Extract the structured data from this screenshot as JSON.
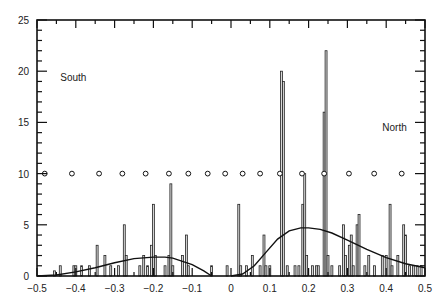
{
  "chart_data": {
    "type": "bar",
    "subtype": "histogram-with-fitted-curves",
    "title": "",
    "xlabel": "",
    "ylabel": "",
    "xlim": [
      -0.5,
      0.5
    ],
    "ylim": [
      0,
      25
    ],
    "grid": false,
    "x_ticks": [
      -0.5,
      -0.4,
      -0.3,
      -0.2,
      -0.1,
      0,
      0.1,
      0.2,
      0.3,
      0.4,
      0.5
    ],
    "x_tick_labels": [
      "-0.5",
      "-0.4",
      "-0.3",
      "-0.2",
      "-0.1",
      "0",
      "0.1",
      "0.2",
      "0.3",
      "0.4",
      "0.5"
    ],
    "y_ticks": [
      0,
      5,
      10,
      15,
      20,
      25
    ],
    "y_tick_labels": [
      "0",
      "5",
      "10",
      "15",
      "20",
      "25"
    ],
    "annotations": [
      {
        "text": "South",
        "x": -0.44,
        "y": 19.0
      },
      {
        "text": "North",
        "x": 0.39,
        "y": 14.2
      }
    ],
    "histogram": {
      "bin_width": 0.005,
      "bars": [
        {
          "x": -0.455,
          "y": 0.5
        },
        {
          "x": -0.44,
          "y": 1
        },
        {
          "x": -0.405,
          "y": 1
        },
        {
          "x": -0.4,
          "y": 1
        },
        {
          "x": -0.385,
          "y": 1
        },
        {
          "x": -0.365,
          "y": 1
        },
        {
          "x": -0.345,
          "y": 3
        },
        {
          "x": -0.325,
          "y": 2
        },
        {
          "x": -0.31,
          "y": 1
        },
        {
          "x": -0.29,
          "y": 1
        },
        {
          "x": -0.275,
          "y": 5
        },
        {
          "x": -0.27,
          "y": 2
        },
        {
          "x": -0.235,
          "y": 1
        },
        {
          "x": -0.225,
          "y": 2
        },
        {
          "x": -0.215,
          "y": 1
        },
        {
          "x": -0.205,
          "y": 3
        },
        {
          "x": -0.2,
          "y": 7
        },
        {
          "x": -0.195,
          "y": 2
        },
        {
          "x": -0.17,
          "y": 1
        },
        {
          "x": -0.16,
          "y": 2
        },
        {
          "x": -0.155,
          "y": 9
        },
        {
          "x": -0.15,
          "y": 1
        },
        {
          "x": -0.125,
          "y": 2
        },
        {
          "x": -0.115,
          "y": 4
        },
        {
          "x": -0.11,
          "y": 1
        },
        {
          "x": -0.05,
          "y": 1
        },
        {
          "x": -0.01,
          "y": 1
        },
        {
          "x": 0.02,
          "y": 7
        },
        {
          "x": 0.025,
          "y": 1
        },
        {
          "x": 0.04,
          "y": 1
        },
        {
          "x": 0.055,
          "y": 2
        },
        {
          "x": 0.075,
          "y": 1
        },
        {
          "x": 0.085,
          "y": 4
        },
        {
          "x": 0.09,
          "y": 1
        },
        {
          "x": 0.1,
          "y": 1
        },
        {
          "x": 0.13,
          "y": 20
        },
        {
          "x": 0.135,
          "y": 19
        },
        {
          "x": 0.145,
          "y": 1
        },
        {
          "x": 0.165,
          "y": 1
        },
        {
          "x": 0.175,
          "y": 1
        },
        {
          "x": 0.185,
          "y": 7
        },
        {
          "x": 0.19,
          "y": 10
        },
        {
          "x": 0.195,
          "y": 2
        },
        {
          "x": 0.21,
          "y": 1
        },
        {
          "x": 0.22,
          "y": 1
        },
        {
          "x": 0.225,
          "y": 1
        },
        {
          "x": 0.24,
          "y": 16
        },
        {
          "x": 0.245,
          "y": 22
        },
        {
          "x": 0.25,
          "y": 2
        },
        {
          "x": 0.26,
          "y": 1
        },
        {
          "x": 0.28,
          "y": 1
        },
        {
          "x": 0.29,
          "y": 5
        },
        {
          "x": 0.295,
          "y": 2
        },
        {
          "x": 0.305,
          "y": 3
        },
        {
          "x": 0.31,
          "y": 4
        },
        {
          "x": 0.315,
          "y": 1
        },
        {
          "x": 0.325,
          "y": 5
        },
        {
          "x": 0.33,
          "y": 6
        },
        {
          "x": 0.345,
          "y": 1
        },
        {
          "x": 0.355,
          "y": 2
        },
        {
          "x": 0.37,
          "y": 1
        },
        {
          "x": 0.39,
          "y": 2
        },
        {
          "x": 0.4,
          "y": 2
        },
        {
          "x": 0.41,
          "y": 7
        },
        {
          "x": 0.415,
          "y": 1
        },
        {
          "x": 0.43,
          "y": 2
        },
        {
          "x": 0.445,
          "y": 5
        },
        {
          "x": 0.45,
          "y": 4
        },
        {
          "x": 0.46,
          "y": 1
        },
        {
          "x": 0.47,
          "y": 1
        },
        {
          "x": 0.48,
          "y": 1
        },
        {
          "x": 0.49,
          "y": 1
        }
      ]
    },
    "series": [
      {
        "name": "South fit",
        "type": "line",
        "x": [
          -0.5,
          -0.45,
          -0.4,
          -0.35,
          -0.3,
          -0.25,
          -0.2,
          -0.17,
          -0.15,
          -0.1,
          -0.07,
          -0.05
        ],
        "values": [
          0,
          0.1,
          0.4,
          0.8,
          1.3,
          1.7,
          1.85,
          1.85,
          1.75,
          1.1,
          0.5,
          0
        ]
      },
      {
        "name": "North fit",
        "type": "line",
        "x": [
          0,
          0.03,
          0.06,
          0.09,
          0.12,
          0.15,
          0.18,
          0.2,
          0.23,
          0.26,
          0.3,
          0.35,
          0.4,
          0.45,
          0.5
        ],
        "values": [
          0,
          0.2,
          1.0,
          2.3,
          3.6,
          4.4,
          4.7,
          4.7,
          4.55,
          4.2,
          3.5,
          2.6,
          1.8,
          1.2,
          0.8
        ]
      },
      {
        "name": "markers at y=10",
        "type": "scatter",
        "x": [
          -0.48,
          -0.41,
          -0.34,
          -0.28,
          -0.22,
          -0.16,
          -0.11,
          -0.06,
          -0.015,
          0.03,
          0.075,
          0.126,
          0.183,
          0.24,
          0.304,
          0.369,
          0.44
        ],
        "values": [
          10,
          10,
          10,
          10,
          10,
          10,
          10,
          10,
          10,
          10,
          10,
          10,
          10,
          10,
          10,
          10,
          10
        ]
      }
    ]
  }
}
